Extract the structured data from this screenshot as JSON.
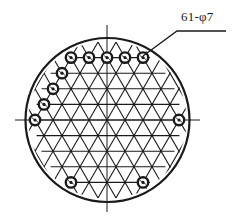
{
  "diagram": {
    "title_label": "61-φ7",
    "hole_count": 61,
    "hole_diameter": "φ7",
    "colors": {
      "ink": "#1a1a1a",
      "background": "#ffffff"
    },
    "outer_circle": {
      "cx": 107.5,
      "cy": 120,
      "r": 82
    },
    "centerlines": {
      "vertical": {
        "x": 107,
        "y1": 25,
        "y2": 212
      },
      "horizontal": {
        "y": 120,
        "x1": 15,
        "x2": 200
      }
    },
    "lattice": {
      "origin_x": 107,
      "origin_y": 120,
      "pitch": 18,
      "row_height": 15.6,
      "rows": [
        -4,
        -3,
        -2,
        -1,
        0,
        1,
        2,
        3,
        4
      ]
    },
    "marked_holes": [
      {
        "row": -4,
        "x": 71
      },
      {
        "row": -4,
        "x": 89
      },
      {
        "row": -4,
        "x": 107
      },
      {
        "row": -4,
        "x": 125
      },
      {
        "row": -4,
        "x": 143
      },
      {
        "row": -3,
        "x": 62
      },
      {
        "row": -2,
        "x": 53
      },
      {
        "row": -1,
        "x": 44
      },
      {
        "row": 0,
        "x": 35
      },
      {
        "row": 0,
        "x": 179
      },
      {
        "row": 4,
        "x": 71
      },
      {
        "row": 4,
        "x": 143
      }
    ],
    "leader": {
      "points": [
        [
          143,
          56
        ],
        [
          177,
          31
        ],
        [
          226,
          31
        ]
      ]
    }
  }
}
